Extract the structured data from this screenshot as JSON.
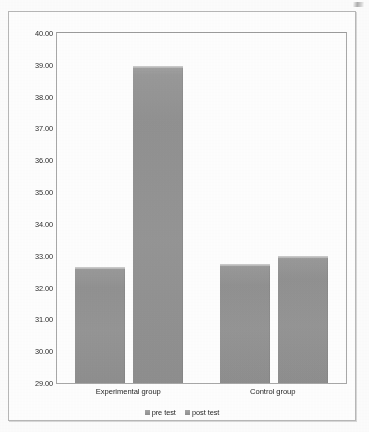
{
  "chart_data": {
    "type": "bar",
    "title": "",
    "xlabel": "",
    "ylabel": "",
    "categories": [
      "Experimental group",
      "Control group"
    ],
    "series": [
      {
        "name": "pre test",
        "values": [
          32.65,
          32.75
        ]
      },
      {
        "name": "post test",
        "values": [
          38.95,
          33.0
        ]
      }
    ],
    "ylim": [
      29.0,
      40.0
    ],
    "ytick_step": 1.0,
    "ytick_labels": [
      "40.00",
      "39.00",
      "38.00",
      "37.00",
      "36.00",
      "35.00",
      "34.00",
      "33.00",
      "32.00",
      "31.00",
      "30.00",
      "29.00"
    ],
    "ytick_values": [
      40,
      39,
      38,
      37,
      36,
      35,
      34,
      33,
      32,
      31,
      30,
      29
    ],
    "grid": false,
    "legend_position": "bottom",
    "bar_color": "#959595",
    "axis_color": "#a9a9a9",
    "text_color": "#272727"
  },
  "legend": {
    "items": [
      {
        "label": "pre test",
        "swatch_icon": "legend-square-icon"
      },
      {
        "label": "post test",
        "swatch_icon": "legend-square-icon"
      }
    ]
  }
}
